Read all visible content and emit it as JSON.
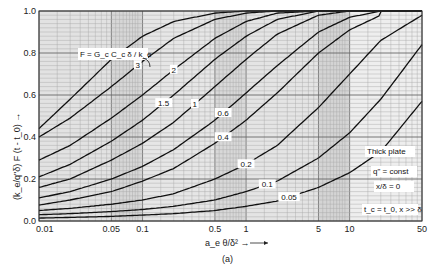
{
  "chart_data": {
    "type": "line",
    "title": "",
    "caption": "(a)",
    "xlabel": "a_e θ/δ² →",
    "ylabel": "(k_e/q\"δ) F (t - t_0) →",
    "xscale": "log",
    "xlim": [
      0.01,
      50
    ],
    "ylim": [
      0.0,
      1.0
    ],
    "grid": true,
    "x_ticks": [
      0.01,
      0.05,
      0.1,
      0.5,
      1,
      5,
      10,
      50
    ],
    "x_tick_labels": [
      "0.01",
      "0.05",
      "0.1",
      "0.5",
      "1",
      "5",
      "10",
      "50"
    ],
    "y_ticks": [
      0.0,
      0.2,
      0.4,
      0.6,
      0.8,
      1.0
    ],
    "y_tick_labels": [
      "0.0",
      "0.2",
      "0.4",
      "0.6",
      "0.8",
      "1.0"
    ],
    "legend_title": "F = G_c C_c δ / k_e",
    "annotations": [
      "Thick plate",
      "q\" = const",
      "x/δ = 0",
      "t_c = t_0,  x >> δ"
    ],
    "series": [
      {
        "name": "F = 5",
        "label": "5",
        "x": [
          0.01,
          0.02,
          0.05,
          0.1,
          0.2,
          0.5,
          1,
          2
        ],
        "y": [
          0.44,
          0.58,
          0.77,
          0.88,
          0.95,
          0.99,
          1.0,
          1.0
        ]
      },
      {
        "name": "F = 3",
        "label": "3",
        "x": [
          0.01,
          0.02,
          0.05,
          0.1,
          0.2,
          0.5,
          1,
          2,
          4
        ],
        "y": [
          0.4,
          0.49,
          0.64,
          0.76,
          0.87,
          0.96,
          0.99,
          1.0,
          1.0
        ]
      },
      {
        "name": "F = 2",
        "label": "2",
        "x": [
          0.01,
          0.02,
          0.05,
          0.1,
          0.2,
          0.5,
          1,
          2,
          5
        ],
        "y": [
          0.29,
          0.36,
          0.49,
          0.6,
          0.72,
          0.87,
          0.95,
          0.99,
          1.0
        ]
      },
      {
        "name": "F = 1.5",
        "label": "1.5",
        "x": [
          0.01,
          0.02,
          0.05,
          0.1,
          0.2,
          0.5,
          1,
          2,
          5
        ],
        "y": [
          0.21,
          0.27,
          0.38,
          0.48,
          0.6,
          0.77,
          0.88,
          0.96,
          1.0
        ]
      },
      {
        "name": "F = 1",
        "label": "1",
        "x": [
          0.01,
          0.02,
          0.05,
          0.1,
          0.2,
          0.5,
          1,
          2,
          5,
          10
        ],
        "y": [
          0.16,
          0.2,
          0.29,
          0.37,
          0.47,
          0.64,
          0.77,
          0.89,
          0.98,
          1.0
        ]
      },
      {
        "name": "F = 0.6",
        "label": "0.6",
        "x": [
          0.01,
          0.02,
          0.05,
          0.1,
          0.2,
          0.5,
          1,
          2,
          5,
          10,
          20
        ],
        "y": [
          0.11,
          0.14,
          0.2,
          0.26,
          0.34,
          0.48,
          0.61,
          0.74,
          0.9,
          0.97,
          1.0
        ]
      },
      {
        "name": "F = 0.4",
        "label": "0.4",
        "x": [
          0.01,
          0.02,
          0.05,
          0.1,
          0.2,
          0.5,
          1,
          2,
          5,
          10,
          20
        ],
        "y": [
          0.076,
          0.1,
          0.14,
          0.19,
          0.25,
          0.37,
          0.48,
          0.61,
          0.8,
          0.91,
          0.98
        ]
      },
      {
        "name": "F = 0.2",
        "label": "0.2",
        "x": [
          0.01,
          0.02,
          0.05,
          0.1,
          0.2,
          0.5,
          1,
          2,
          5,
          10,
          20,
          50
        ],
        "y": [
          0.05,
          0.06,
          0.08,
          0.1,
          0.13,
          0.2,
          0.27,
          0.36,
          0.54,
          0.7,
          0.86,
          0.98
        ]
      },
      {
        "name": "F = 0.1",
        "label": "0.1",
        "x": [
          0.01,
          0.02,
          0.05,
          0.1,
          0.2,
          0.5,
          1,
          2,
          5,
          10,
          20,
          50
        ],
        "y": [
          0.03,
          0.035,
          0.045,
          0.055,
          0.07,
          0.1,
          0.14,
          0.19,
          0.3,
          0.42,
          0.58,
          0.84
        ]
      },
      {
        "name": "F = 0.05",
        "label": "0.05",
        "x": [
          0.01,
          0.02,
          0.05,
          0.1,
          0.2,
          0.5,
          1,
          2,
          5,
          10,
          20,
          50
        ],
        "y": [
          0.014,
          0.017,
          0.022,
          0.028,
          0.035,
          0.05,
          0.07,
          0.095,
          0.16,
          0.23,
          0.33,
          0.57
        ]
      }
    ],
    "label_positions": [
      {
        "label": "5",
        "x": 0.06
      },
      {
        "label": "3",
        "x": 0.09
      },
      {
        "label": "2",
        "x": 0.2
      },
      {
        "label": "1.5",
        "x": 0.16
      },
      {
        "label": "1",
        "x": 0.32
      },
      {
        "label": "0.6",
        "x": 0.6
      },
      {
        "label": "0.4",
        "x": 0.6
      },
      {
        "label": "0.2",
        "x": 1.0
      },
      {
        "label": "0.1",
        "x": 1.6
      },
      {
        "label": "0.05",
        "x": 2.6
      }
    ]
  }
}
